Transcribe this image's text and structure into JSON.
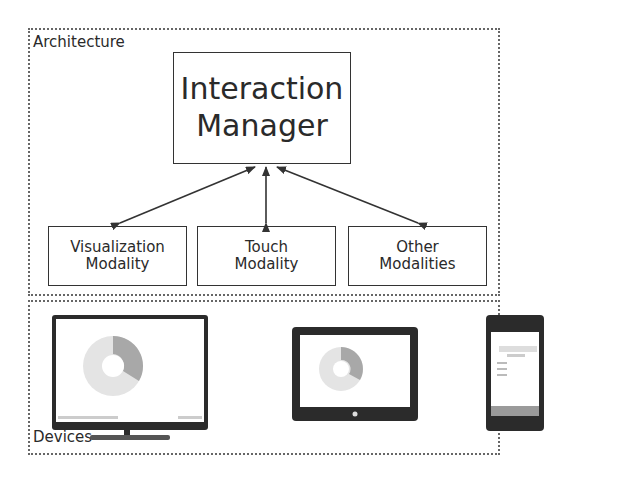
{
  "architecture": {
    "label": "Architecture",
    "manager": {
      "line1": "Interaction",
      "line2": "Manager"
    },
    "modalities": [
      {
        "line1": "Visualization",
        "line2": "Modality"
      },
      {
        "line1": "Touch",
        "line2": "Modality"
      },
      {
        "line1": "Other",
        "line2": "Modalities"
      }
    ]
  },
  "devices": {
    "label": "Devices",
    "items": [
      {
        "name": "TV display"
      },
      {
        "name": "Tablet"
      },
      {
        "name": "Smartphone"
      }
    ]
  },
  "colors": {
    "line": "#333333",
    "border_dotted": "#666666",
    "screen_bezel": "#2b2b2b"
  }
}
